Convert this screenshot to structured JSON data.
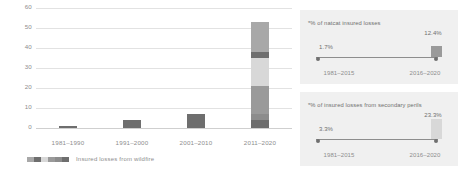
{
  "chart_data": [
    {
      "type": "bar",
      "title": "",
      "xlabel": "",
      "ylabel": "",
      "ylim": [
        0,
        60
      ],
      "yticks": [
        0,
        10,
        20,
        30,
        40,
        50,
        60
      ],
      "grid": true,
      "legend": "Insured losses from wildfire",
      "legend_position": "bottom-left",
      "categories": [
        "1981–1990",
        "1991–2000",
        "2001–2010",
        "2011–2020"
      ],
      "values": [
        1,
        4,
        7,
        53
      ],
      "stacked_last_bar": {
        "category": "2011–2020",
        "segments": [
          {
            "label": "2011–2015",
            "value": 4,
            "color": "#6e6e6e"
          },
          {
            "label": "2016",
            "value": 3,
            "color": "#8c8c8c"
          },
          {
            "label": "2017",
            "value": 14,
            "color": "#9a9a9a"
          },
          {
            "label": "2018",
            "value": 14,
            "color": "#d8d8d8"
          },
          {
            "label": "2019",
            "value": 3,
            "color": "#6e6e6e"
          },
          {
            "label": "2020",
            "value": 15,
            "color": "#a8a8a8"
          }
        ]
      },
      "bar_colors": [
        "#6e6e6e",
        "#6e6e6e",
        "#6e6e6e"
      ]
    },
    {
      "type": "bar",
      "title": "*% of natcat insured losses",
      "categories": [
        "1981–2015",
        "2016–2020"
      ],
      "values": [
        1.7,
        12.4
      ],
      "value_labels": [
        "1.7%",
        "12.4%"
      ],
      "ylim": [
        0,
        25
      ],
      "grid": false,
      "bar_color": "#9a9a9a"
    },
    {
      "type": "bar",
      "title": "*% of insured losses from secondary perils",
      "categories": [
        "1981–2015",
        "2016–2020"
      ],
      "values": [
        3.3,
        23.3
      ],
      "value_labels": [
        "3.3%",
        "23.3%"
      ],
      "ylim": [
        0,
        25
      ],
      "grid": false,
      "bar_color": "#d8d8d8"
    }
  ],
  "main": {
    "yticks": [
      "60",
      "50",
      "40",
      "30",
      "20",
      "10",
      "0"
    ],
    "xlabels": [
      "1981–1990",
      "1991–2000",
      "2001–2010",
      "2011–2020"
    ],
    "segment_labels": [
      "2020",
      "2019",
      "2018",
      "2017",
      "2016",
      "2011–2015"
    ],
    "legend_label": "Insured losses from wildfire"
  },
  "panel_natcat": {
    "title": "*% of natcat insured losses",
    "left_value": "1.7%",
    "right_value": "12.4%",
    "left_period": "1981–2015",
    "right_period": "2016–2020"
  },
  "panel_secondary": {
    "title": "*% of insured losses from secondary perils",
    "left_value": "3.3%",
    "right_value": "23.3%",
    "left_period": "1981–2015",
    "right_period": "2016–2020"
  },
  "colors": {
    "bar_dark": "#6e6e6e",
    "bar_mid": "#9a9a9a",
    "bar_light": "#d8d8d8",
    "panel_bg": "#f0f0f0",
    "grid": "#e2e2e2",
    "text": "#8d8d8d"
  }
}
